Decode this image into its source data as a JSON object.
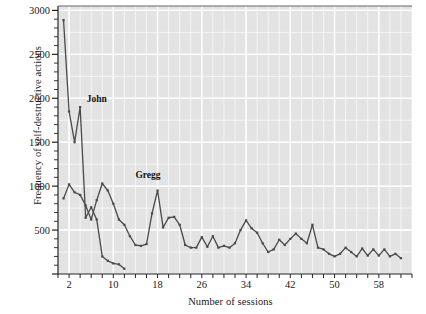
{
  "chart_data": {
    "type": "line",
    "title": "",
    "xlabel": "Number of sessions",
    "ylabel": "Frequency of self-destructive actions",
    "xlim": [
      0,
      64
    ],
    "ylim": [
      0,
      3050
    ],
    "xticks": [
      2,
      10,
      18,
      26,
      34,
      42,
      50,
      58
    ],
    "yticks": [
      500,
      1000,
      1500,
      2000,
      2500,
      3000
    ],
    "ytick_labels": [
      "500",
      "1000",
      "1500",
      "2000",
      "2500",
      "3000"
    ],
    "xtick_labels": [
      "2",
      "10",
      "18",
      "26",
      "34",
      "42",
      "50",
      "58"
    ],
    "grid": true,
    "grid_color": "#ffffff",
    "plot_background": "#e3e3e3",
    "line_color": "#4a4a4a",
    "marker": "square",
    "legend_position": "inline-annotations",
    "annotations": [
      {
        "text": "John",
        "x": 5.2,
        "y": 1980
      },
      {
        "text": "Gregg",
        "x": 14.0,
        "y": 1120
      }
    ],
    "series": [
      {
        "name": "John",
        "label": "John",
        "x": [
          1,
          2,
          3,
          4,
          5,
          6,
          7,
          8,
          9,
          10,
          11,
          12
        ],
        "values": [
          2890,
          1850,
          1500,
          1900,
          640,
          760,
          620,
          200,
          150,
          120,
          110,
          60
        ]
      },
      {
        "name": "Gregg",
        "label": "Gregg",
        "x": [
          1,
          2,
          3,
          4,
          5,
          6,
          7,
          8,
          9,
          10,
          11,
          12,
          13,
          14,
          15,
          16,
          17,
          18,
          19,
          20,
          21,
          22,
          23,
          24,
          25,
          26,
          27,
          28,
          29,
          30,
          31,
          32,
          33,
          34,
          35,
          36,
          37,
          38,
          39,
          40,
          41,
          42,
          43,
          44,
          45,
          46,
          47,
          48,
          49,
          50,
          51,
          52,
          53,
          54,
          55,
          56,
          57,
          58,
          59,
          60,
          61,
          62
        ],
        "values": [
          860,
          1020,
          930,
          900,
          780,
          620,
          840,
          1030,
          950,
          800,
          620,
          560,
          430,
          330,
          320,
          340,
          690,
          950,
          530,
          640,
          650,
          560,
          330,
          300,
          300,
          420,
          310,
          430,
          300,
          320,
          300,
          350,
          500,
          610,
          520,
          470,
          350,
          250,
          280,
          390,
          330,
          400,
          460,
          400,
          350,
          560,
          300,
          280,
          230,
          200,
          230,
          300,
          250,
          200,
          290,
          210,
          280,
          210,
          280,
          200,
          230,
          180
        ]
      }
    ]
  },
  "axis": {
    "ylabel": "Frequency of self-destructive actions",
    "xlabel": "Number of sessions"
  }
}
